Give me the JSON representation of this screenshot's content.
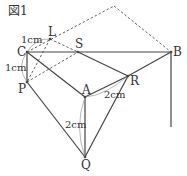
{
  "figure": {
    "title": "図1"
  },
  "points": {
    "C": "C",
    "L": "L",
    "S": "S",
    "B": "B",
    "P": "P",
    "A": "A",
    "R": "R",
    "Q": "Q"
  },
  "measurements": {
    "CL": "1cm",
    "CP": "1cm",
    "AR": "2cm",
    "AQ": "2cm"
  },
  "colors": {
    "line": "#444444",
    "dashed": "#555555",
    "arc": "#999999",
    "text": "#333333"
  }
}
